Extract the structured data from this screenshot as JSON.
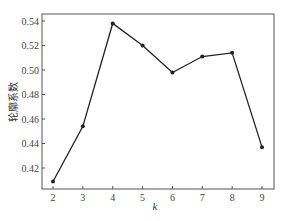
{
  "chart_data": {
    "type": "line",
    "title": "",
    "xlabel": "k",
    "ylabel": "轮廓系数",
    "x": [
      2,
      3,
      4,
      5,
      6,
      7,
      8,
      9
    ],
    "series": [
      {
        "name": "轮廓系数",
        "values": [
          0.409,
          0.454,
          0.538,
          0.52,
          0.498,
          0.511,
          0.514,
          0.437
        ],
        "color": "#222222",
        "marker": "circle"
      }
    ],
    "xticks": [
      "2",
      "3",
      "4",
      "5",
      "6",
      "7",
      "8",
      "9"
    ],
    "yticks": [
      "0.42",
      "0.44",
      "0.46",
      "0.48",
      "0.50",
      "0.52",
      "0.54"
    ],
    "ylim": [
      0.403,
      0.545
    ],
    "xlim": [
      1.63,
      9.4
    ],
    "grid": false,
    "legend": null
  }
}
